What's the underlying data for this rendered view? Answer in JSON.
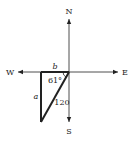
{
  "compass": {
    "north": "N",
    "south": "S",
    "east": "E",
    "west": "W"
  },
  "triangle": {
    "side_top_label": "b",
    "side_left_label": "a",
    "hypotenuse_label": "120",
    "angle_label": "61°"
  },
  "colors": {
    "line": "#222222",
    "background": "#ffffff"
  }
}
